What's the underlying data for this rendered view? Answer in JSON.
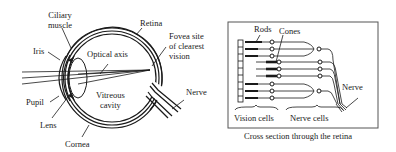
{
  "eye_diagram": {
    "labels": {
      "ciliary_muscle": [
        "Ciliary",
        "muscle"
      ],
      "retina": "Retina",
      "iris": "Iris",
      "optical_axis": "Optical axis",
      "fovea": [
        "Fovea site",
        "of clearest",
        "vision"
      ],
      "nerve": "Nerve",
      "pupil": "Pupil",
      "vitreous_cavity": [
        "Vitreous",
        "cavity"
      ],
      "lens": "Lens",
      "cornea": "Cornea"
    }
  },
  "retina_diagram": {
    "labels": {
      "rods": "Rods",
      "cones": "Cones",
      "nerve": "Nerve",
      "vision_cells": "Vision cells",
      "nerve_cells": "Nerve cells"
    },
    "caption": "Cross section through the retina"
  }
}
